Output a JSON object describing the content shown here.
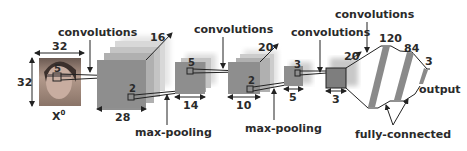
{
  "diagram": {
    "colors": {
      "fmap": "#8e8e8e",
      "fmap_back": "#d6d6d6",
      "fc_bar": "#8a8a8a",
      "text": "#2a2a2a",
      "line": "#222222"
    },
    "input": {
      "label": "X",
      "superscript": "0",
      "width": "32",
      "height": "32",
      "kernel": "5"
    },
    "layers": [
      {
        "id": "conv1",
        "type": "feature-maps",
        "depth": "16",
        "size": "28",
        "kernel": "2"
      },
      {
        "id": "pool1",
        "type": "feature-maps",
        "size": "14",
        "kernel": "5"
      },
      {
        "id": "conv2",
        "type": "feature-maps",
        "depth": "20",
        "size": "10",
        "kernel": "2"
      },
      {
        "id": "pool2",
        "type": "feature-maps",
        "size": "5",
        "kernel": "3"
      },
      {
        "id": "conv3",
        "type": "feature-maps",
        "depth": "20",
        "size": "3"
      }
    ],
    "fully_connected": [
      {
        "units": "120"
      },
      {
        "units": "84"
      },
      {
        "units": "3"
      }
    ],
    "annotations": {
      "conv1": "convolutions",
      "conv2": "convolutions",
      "conv3": "convolutions",
      "conv4": "convolutions",
      "pool1": "max-pooling",
      "pool2": "max-pooling",
      "fc": "fully-connected",
      "output": "output"
    }
  }
}
